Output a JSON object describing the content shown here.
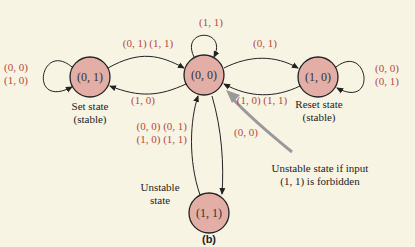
{
  "colors": {
    "background": "#f8f4e4",
    "node_fill": "#e2aea6",
    "node_stroke": "#222222",
    "edge_label": "#b5483d",
    "pointer_arrow": "#999999"
  },
  "nodes": [
    {
      "id": "n01",
      "label": "(0, 1)",
      "caption1": "Set state",
      "caption2": "(stable)"
    },
    {
      "id": "n00",
      "label": "(0, 0)"
    },
    {
      "id": "n10",
      "label": "(1, 0)",
      "caption1": "Reset state",
      "caption2": "(stable)"
    },
    {
      "id": "n11",
      "label": "(1, 1)",
      "caption1": "Unstable",
      "caption2": "state"
    }
  ],
  "edges": {
    "self_01": [
      "(0, 0)",
      "(1, 0)"
    ],
    "n01_to_n00": "(0, 1) (1, 1)",
    "n00_to_n01": "(1, 0)",
    "self_00": "(1, 1)",
    "n00_to_n10": "(0, 1)",
    "n10_to_n00": "(1, 0) (1, 1)",
    "self_10": [
      "(0, 0)",
      "(0, 1)"
    ],
    "n11_to_n00": [
      "(0, 0) (0, 1)",
      "(1, 0) (1, 1)"
    ],
    "n00_to_n11": "(0, 0)"
  },
  "annotation": {
    "line1": "Unstable state if input",
    "line2": "(1, 1) is forbidden"
  },
  "caption": "(b)"
}
